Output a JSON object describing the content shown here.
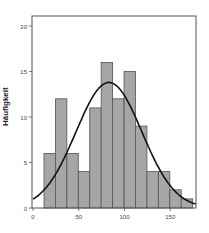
{
  "chart_data": {
    "type": "bar",
    "subtype": "histogram_with_normal_curve",
    "title": "",
    "xlabel": "",
    "ylabel": "Häufigkeit",
    "xlim": [
      0,
      178
    ],
    "ylim": [
      0,
      21
    ],
    "x_ticks": [
      0,
      50,
      100,
      150
    ],
    "y_ticks": [
      0,
      5,
      10,
      15,
      20
    ],
    "bin_start": 12,
    "bin_width": 12.5,
    "bins": [
      {
        "from": 12.0,
        "to": 24.5,
        "count": 6
      },
      {
        "from": 24.5,
        "to": 37.0,
        "count": 12
      },
      {
        "from": 37.0,
        "to": 49.5,
        "count": 6
      },
      {
        "from": 49.5,
        "to": 62.0,
        "count": 4
      },
      {
        "from": 62.0,
        "to": 74.5,
        "count": 11
      },
      {
        "from": 74.5,
        "to": 87.0,
        "count": 16
      },
      {
        "from": 87.0,
        "to": 99.5,
        "count": 12
      },
      {
        "from": 99.5,
        "to": 112.0,
        "count": 15
      },
      {
        "from": 112.0,
        "to": 124.5,
        "count": 9
      },
      {
        "from": 124.5,
        "to": 137.0,
        "count": 4
      },
      {
        "from": 137.0,
        "to": 149.5,
        "count": 4
      },
      {
        "from": 149.5,
        "to": 162.0,
        "count": 2
      },
      {
        "from": 162.0,
        "to": 174.5,
        "count": 1
      }
    ],
    "normal_curve": {
      "mean": 83,
      "sd": 36,
      "peak": 13.8
    },
    "grid": false,
    "legend": null,
    "colors": {
      "bar_fill": "#a6a6a6",
      "bar_stroke": "#555555",
      "curve": "#111111",
      "frame": "#555555"
    }
  }
}
